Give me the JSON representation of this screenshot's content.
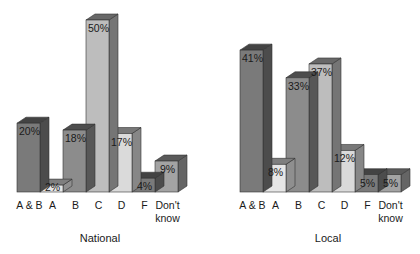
{
  "chart_data": [
    {
      "type": "bar",
      "style": "3d",
      "title": "National",
      "categories": [
        "A & B",
        "A",
        "B",
        "C",
        "D",
        "F",
        "Don't know"
      ],
      "values": [
        20,
        2,
        18,
        50,
        17,
        4,
        9
      ],
      "value_labels": [
        "20%",
        "2%",
        "18%",
        "50%",
        "17%",
        "4%",
        "9%"
      ],
      "unit": "%",
      "ylim": [
        0,
        50
      ],
      "grid": false,
      "legend": "none",
      "bar_colors": [
        "#7a7a7a",
        "#e6e6e6",
        "#8c8c8c",
        "#bdbdbd",
        "#dadada",
        "#7a7a7a",
        "#a3a3a3"
      ]
    },
    {
      "type": "bar",
      "style": "3d",
      "title": "Local",
      "categories": [
        "A & B",
        "A",
        "B",
        "C",
        "D",
        "F",
        "Don't know"
      ],
      "values": [
        41,
        8,
        33,
        37,
        12,
        5,
        5
      ],
      "value_labels": [
        "41%",
        "8%",
        "33%",
        "37%",
        "12%",
        "5%",
        "5%"
      ],
      "unit": "%",
      "ylim": [
        0,
        50
      ],
      "grid": false,
      "legend": "none",
      "bar_colors": [
        "#7a7a7a",
        "#e6e6e6",
        "#8c8c8c",
        "#bdbdbd",
        "#dadada",
        "#7a7a7a",
        "#a3a3a3"
      ]
    }
  ]
}
